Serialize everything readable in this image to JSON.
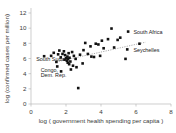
{
  "chart_data": {
    "type": "scatter",
    "title": "",
    "xlabel": "log ( government health spending per capita )",
    "ylabel": "log (confirmed cases per million)",
    "xlim": [
      0,
      8
    ],
    "ylim": [
      0,
      12
    ],
    "xticks": [
      0,
      2,
      4,
      6,
      8
    ],
    "yticks": [
      0,
      2,
      4,
      6,
      8,
      10,
      12
    ],
    "grid": false,
    "legend": null,
    "points": [
      {
        "x": 0.75,
        "y": 6.3
      },
      {
        "x": 1.15,
        "y": 6.35
      },
      {
        "x": 1.3,
        "y": 6.75
      },
      {
        "x": 1.45,
        "y": 5.55
      },
      {
        "x": 1.5,
        "y": 4.95
      },
      {
        "x": 1.55,
        "y": 6.55
      },
      {
        "x": 1.62,
        "y": 7.05
      },
      {
        "x": 1.7,
        "y": 6.15
      },
      {
        "x": 1.72,
        "y": 4.3
      },
      {
        "x": 1.8,
        "y": 6.6
      },
      {
        "x": 1.88,
        "y": 6.95
      },
      {
        "x": 1.92,
        "y": 5.85
      },
      {
        "x": 1.95,
        "y": 6.45
      },
      {
        "x": 2.0,
        "y": 6.05
      },
      {
        "x": 2.05,
        "y": 5.7
      },
      {
        "x": 2.08,
        "y": 6.25
      },
      {
        "x": 2.1,
        "y": 5.45
      },
      {
        "x": 2.12,
        "y": 5.9
      },
      {
        "x": 2.15,
        "y": 6.7
      },
      {
        "x": 2.18,
        "y": 5.25
      },
      {
        "x": 2.2,
        "y": 6.1
      },
      {
        "x": 2.25,
        "y": 5.6
      },
      {
        "x": 2.28,
        "y": 4.55
      },
      {
        "x": 2.35,
        "y": 6.85
      },
      {
        "x": 2.4,
        "y": 5.05
      },
      {
        "x": 2.45,
        "y": 6.35
      },
      {
        "x": 2.55,
        "y": 5.95
      },
      {
        "x": 2.6,
        "y": 4.85
      },
      {
        "x": 2.7,
        "y": 2.1
      },
      {
        "x": 2.8,
        "y": 6.5
      },
      {
        "x": 2.95,
        "y": 5.35
      },
      {
        "x": 3.0,
        "y": 7.1
      },
      {
        "x": 3.1,
        "y": 8.05
      },
      {
        "x": 3.25,
        "y": 6.6
      },
      {
        "x": 3.4,
        "y": 7.6
      },
      {
        "x": 3.45,
        "y": 6.25
      },
      {
        "x": 3.6,
        "y": 6.2
      },
      {
        "x": 3.7,
        "y": 7.95
      },
      {
        "x": 3.85,
        "y": 7.85
      },
      {
        "x": 3.95,
        "y": 6.35
      },
      {
        "x": 4.05,
        "y": 8.35
      },
      {
        "x": 4.15,
        "y": 7.35
      },
      {
        "x": 4.4,
        "y": 8.55
      },
      {
        "x": 4.6,
        "y": 9.95
      },
      {
        "x": 4.75,
        "y": 7.45
      },
      {
        "x": 4.95,
        "y": 8.45
      },
      {
        "x": 5.1,
        "y": 8.75
      },
      {
        "x": 5.4,
        "y": 5.95
      },
      {
        "x": 5.55,
        "y": 9.55
      },
      {
        "x": 5.5,
        "y": 7.2
      },
      {
        "x": 6.2,
        "y": 7.95
      }
    ],
    "annotations": [
      {
        "label": "South Africa",
        "x": 5.55,
        "y": 9.55,
        "lx": 5.85,
        "ly": 9.5
      },
      {
        "label": "Seychelles",
        "x": 5.5,
        "y": 7.2,
        "lx": 5.85,
        "ly": 7.15
      },
      {
        "label": "South Sudan",
        "x": 1.45,
        "y": 5.55,
        "lx": 0.3,
        "ly": 5.9
      },
      {
        "label": "Congo,",
        "x": 1.72,
        "y": 4.3,
        "lx": 0.55,
        "ly": 4.45
      },
      {
        "label": "Dem. Rep.",
        "x": 1.72,
        "y": 4.3,
        "lx": 0.55,
        "ly": 3.8
      }
    ],
    "trendline": {
      "x0": 1.45,
      "y0": 5.55,
      "x1": 6.55,
      "y1": 8.15
    }
  },
  "colors": {
    "point": "#111111",
    "trend": "#8d8d8d",
    "axis": "#b9b9b9",
    "text": "#3a3a3a",
    "background": "#ffffff"
  }
}
